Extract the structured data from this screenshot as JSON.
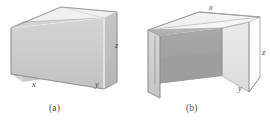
{
  "figure": {
    "kind": "geometry-diagram",
    "background_color": "#ffffff",
    "panels": [
      {
        "id": "a",
        "caption": "(a)",
        "shape_name": "open-top-rectangular-box",
        "shape_description": "Rectangular box with no lid; interior floor and inner walls visible from above.",
        "labels": [
          {
            "name": "x",
            "text": "x",
            "edge": "bottom-left-front-edge"
          },
          {
            "name": "y",
            "text": "y",
            "edge": "bottom-right-front-edge"
          },
          {
            "name": "z",
            "text": "z",
            "edge": "right-vertical-edge"
          }
        ],
        "colors": {
          "top_rim": "#f0f0f0",
          "front_left_face": "#c9c9c9",
          "front_right_face": "#bdbdbd",
          "interior_floor": "#cfcfcf",
          "interior_back": "#d6d6d6",
          "outline": "#8a8a8a",
          "highlight_edge": "#ffffff"
        }
      },
      {
        "id": "b",
        "caption": "(b)",
        "shape_name": "open-front-and-back-box",
        "shape_description": "Rectangular box consisting of a top panel and two vertical side panels; open at the front and back like a tunnel.",
        "labels": [
          {
            "name": "x",
            "text": "x",
            "edge": "top-rear-edge"
          },
          {
            "name": "y",
            "text": "y",
            "edge": "bottom-right-front-edge"
          },
          {
            "name": "z",
            "text": "z",
            "edge": "right-vertical-edge"
          }
        ],
        "colors": {
          "top_face": "#f2f2f2",
          "left_side_outer": "#cdcdcd",
          "right_side_outer": "#e2e2e2",
          "interior_ceiling": "#b0b0b0",
          "interior_far_wall": "#a2a2a2",
          "interior_shadow": "#9a9a9a",
          "outline": "#8a8a8a"
        }
      }
    ]
  }
}
